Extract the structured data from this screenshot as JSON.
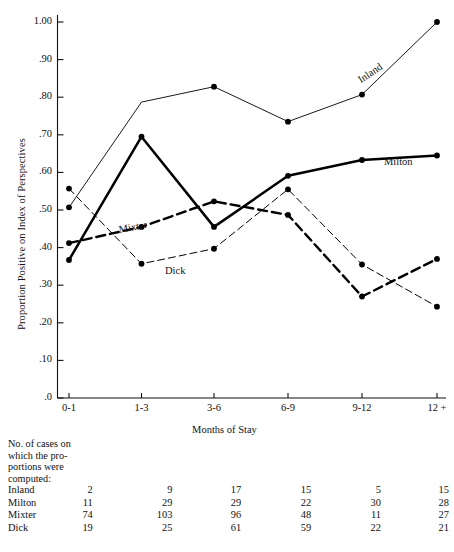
{
  "chart_data": {
    "type": "line",
    "title": "",
    "xlabel": "Months of Stay",
    "ylabel": "Proportion Positive on Index of Perspectives",
    "categories": [
      "0-1",
      "1-3",
      "3-6",
      "6-9",
      "9-12",
      "12 +"
    ],
    "ylim": [
      0.0,
      1.0
    ],
    "ytick_labels": [
      "1.00",
      ".90",
      ".80",
      ".70",
      ".60",
      ".50",
      ".40",
      ".30",
      ".20",
      ".10",
      ".0"
    ],
    "ytick_values": [
      1.0,
      0.9,
      0.8,
      0.7,
      0.6,
      0.5,
      0.4,
      0.3,
      0.2,
      0.1,
      0.0
    ],
    "grid": false,
    "legend_position": "inline-on-lines",
    "series": [
      {
        "name": "Inland",
        "style": "thin-solid",
        "color": "#000000",
        "values": [
          0.507,
          0.787,
          0.828,
          0.735,
          0.807,
          1.0
        ],
        "markers": [
          true,
          false,
          true,
          true,
          true,
          true
        ]
      },
      {
        "name": "Milton",
        "style": "thick-solid",
        "color": "#000000",
        "values": [
          0.367,
          0.695,
          0.455,
          0.591,
          0.633,
          0.645
        ],
        "markers": [
          true,
          true,
          true,
          true,
          true,
          true
        ]
      },
      {
        "name": "Mixter",
        "style": "thick-dashed",
        "color": "#000000",
        "values": [
          0.412,
          0.455,
          0.523,
          0.487,
          0.27,
          0.37
        ],
        "markers": [
          true,
          true,
          true,
          true,
          true,
          true
        ]
      },
      {
        "name": "Dick",
        "style": "thin-dashed",
        "color": "#000000",
        "values": [
          0.557,
          0.357,
          0.397,
          0.555,
          0.355,
          0.243
        ],
        "markers": [
          true,
          true,
          true,
          true,
          true,
          true
        ]
      }
    ]
  },
  "note": {
    "lines": [
      "No. of cases on",
      "which the pro-",
      "portions were",
      "computed:"
    ]
  },
  "counts_table": {
    "rows": [
      {
        "label": "Inland",
        "values": [
          "2",
          "9",
          "17",
          "15",
          "5",
          "15"
        ]
      },
      {
        "label": "Milton",
        "values": [
          "11",
          "29",
          "29",
          "22",
          "30",
          "28"
        ]
      },
      {
        "label": "Mixter",
        "values": [
          "74",
          "103",
          "96",
          "48",
          "11",
          "27"
        ]
      },
      {
        "label": "Dick",
        "values": [
          "19",
          "25",
          "61",
          "59",
          "22",
          "21"
        ]
      }
    ]
  }
}
